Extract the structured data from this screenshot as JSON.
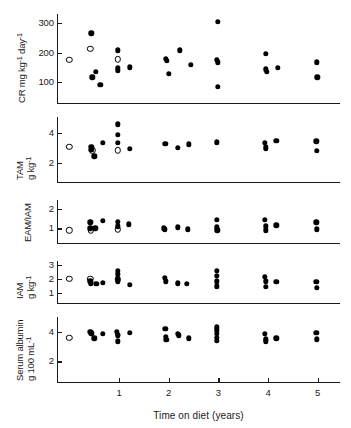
{
  "figure": {
    "xlabel": "Time on diet (years)",
    "x_ticks": [
      "1",
      "2",
      "3",
      "4",
      "5"
    ],
    "x_tick_values": [
      1,
      2,
      3,
      4,
      5
    ],
    "x_range": [
      -0.25,
      5.45
    ]
  },
  "panels": [
    {
      "id": "cr",
      "ylabel_line1": "CR  mg  kg",
      "ylabel_sup1": "-1",
      "ylabel_mid": " day",
      "ylabel_sup2": "-1",
      "ylabel_plain": "CR mg kg-1 day-1",
      "y_ticks": [
        "300",
        "200",
        "100"
      ],
      "y_tick_values": [
        300,
        200,
        100
      ],
      "y_range": [
        30,
        330
      ]
    },
    {
      "id": "tam",
      "ylabel_line1": "TAM",
      "ylabel_line2": "g kg",
      "ylabel_sup1": "-1",
      "ylabel_plain": "TAM g kg-1",
      "y_ticks": [
        "4",
        "2"
      ],
      "y_tick_values": [
        4,
        2
      ],
      "y_range": [
        0.7,
        5.1
      ]
    },
    {
      "id": "eam_iam",
      "ylabel_line1": "EAM/IAM",
      "ylabel_plain": "EAM/IAM",
      "y_ticks": [
        "2",
        "1"
      ],
      "y_tick_values": [
        2,
        1
      ],
      "y_range": [
        0.25,
        2.45
      ]
    },
    {
      "id": "iam",
      "ylabel_line1": "IAM",
      "ylabel_line2": "g kg",
      "ylabel_sup1": "-1",
      "ylabel_plain": "IAM g kg-1",
      "y_ticks": [
        "3",
        "2",
        "1"
      ],
      "y_tick_values": [
        3,
        2,
        1
      ],
      "y_range": [
        0.3,
        3.3
      ]
    },
    {
      "id": "albumin",
      "ylabel_line1": "Serum albumin",
      "ylabel_line2": "g 100 mL",
      "ylabel_sup1": "-1",
      "ylabel_plain": "Serum albumin g 100 mL-1",
      "y_ticks": [
        "4",
        "2"
      ],
      "y_tick_values": [
        4,
        2
      ],
      "y_range": [
        0.6,
        5.0
      ]
    }
  ],
  "chart_data": {
    "type": "scatter",
    "title": "",
    "xlabel": "Time on diet (years)",
    "legend": [],
    "grid": false,
    "xlim": [
      -0.25,
      5.45
    ],
    "x_ticks": [
      1,
      2,
      3,
      4,
      5
    ],
    "marker_types": {
      "filled": "on-diet measurement",
      "open": "baseline / pre-diet measurement"
    },
    "subplots": [
      {
        "id": "cr",
        "ylabel": "CR mg kg-1 day-1",
        "ylim": [
          30,
          330
        ],
        "y_ticks": [
          300,
          200,
          100
        ],
        "points_filled": [
          [
            0.44,
            265
          ],
          [
            0.46,
            117
          ],
          [
            0.53,
            135
          ],
          [
            0.62,
            92
          ],
          [
            0.97,
            207
          ],
          [
            0.97,
            148
          ],
          [
            0.97,
            140
          ],
          [
            1.22,
            150
          ],
          [
            1.94,
            180
          ],
          [
            1.96,
            173
          ],
          [
            2.0,
            128
          ],
          [
            2.22,
            208
          ],
          [
            2.44,
            158
          ],
          [
            2.99,
            303
          ],
          [
            2.97,
            175
          ],
          [
            2.99,
            167
          ],
          [
            2.99,
            85
          ],
          [
            3.95,
            196
          ],
          [
            3.96,
            143
          ],
          [
            3.97,
            136
          ],
          [
            4.2,
            148
          ],
          [
            4.98,
            167
          ],
          [
            4.99,
            117
          ]
        ],
        "points_open": [
          [
            0.0,
            175
          ],
          [
            0.42,
            212
          ],
          [
            0.97,
            177
          ]
        ]
      },
      {
        "id": "tam",
        "ylabel": "TAM g kg-1",
        "ylim": [
          0.7,
          5.1
        ],
        "y_ticks": [
          4,
          2
        ],
        "points_filled": [
          [
            0.44,
            3.1
          ],
          [
            0.44,
            2.9
          ],
          [
            0.5,
            2.45
          ],
          [
            0.67,
            3.35
          ],
          [
            0.97,
            4.6
          ],
          [
            0.97,
            3.9
          ],
          [
            0.97,
            3.35
          ],
          [
            1.22,
            2.95
          ],
          [
            1.93,
            3.3
          ],
          [
            2.18,
            3.0
          ],
          [
            2.4,
            3.25
          ],
          [
            2.97,
            3.4
          ],
          [
            3.94,
            3.35
          ],
          [
            3.95,
            3.1
          ],
          [
            3.95,
            2.95
          ],
          [
            4.17,
            3.5
          ],
          [
            4.97,
            3.45
          ],
          [
            4.98,
            2.8
          ]
        ],
        "points_open": [
          [
            0.0,
            3.1
          ],
          [
            0.46,
            2.85
          ],
          [
            0.97,
            2.85
          ]
        ]
      },
      {
        "id": "eam_iam",
        "ylabel": "EAM/IAM",
        "ylim": [
          0.25,
          2.45
        ],
        "y_ticks": [
          2,
          1
        ],
        "points_filled": [
          [
            0.42,
            1.3
          ],
          [
            0.42,
            1.0
          ],
          [
            0.52,
            1.0
          ],
          [
            0.67,
            1.4
          ],
          [
            0.97,
            1.35
          ],
          [
            0.97,
            1.1
          ],
          [
            1.2,
            1.2
          ],
          [
            1.9,
            1.0
          ],
          [
            1.92,
            0.95
          ],
          [
            2.18,
            1.05
          ],
          [
            2.38,
            0.95
          ],
          [
            2.97,
            1.45
          ],
          [
            2.97,
            1.05
          ],
          [
            2.98,
            0.9
          ],
          [
            3.94,
            1.45
          ],
          [
            3.95,
            1.1
          ],
          [
            3.96,
            0.9
          ],
          [
            4.17,
            1.15
          ],
          [
            4.97,
            1.3
          ],
          [
            4.98,
            0.95
          ]
        ],
        "points_open": [
          [
            0.0,
            0.9
          ],
          [
            0.43,
            0.9
          ],
          [
            0.97,
            0.95
          ]
        ]
      },
      {
        "id": "iam",
        "ylabel": "IAM g kg-1",
        "ylim": [
          0.3,
          3.3
        ],
        "y_ticks": [
          3,
          2,
          1
        ],
        "points_filled": [
          [
            0.42,
            1.85
          ],
          [
            0.43,
            1.7
          ],
          [
            0.54,
            1.65
          ],
          [
            0.67,
            1.75
          ],
          [
            0.97,
            2.6
          ],
          [
            0.97,
            2.35
          ],
          [
            0.97,
            2.05
          ],
          [
            0.97,
            1.85
          ],
          [
            1.22,
            1.6
          ],
          [
            1.92,
            2.1
          ],
          [
            1.94,
            1.85
          ],
          [
            2.18,
            1.7
          ],
          [
            2.36,
            1.65
          ],
          [
            2.97,
            2.6
          ],
          [
            2.97,
            2.25
          ],
          [
            2.97,
            1.85
          ],
          [
            2.97,
            1.5
          ],
          [
            3.94,
            2.15
          ],
          [
            3.95,
            1.85
          ],
          [
            3.95,
            1.45
          ],
          [
            4.17,
            1.8
          ],
          [
            4.97,
            1.8
          ],
          [
            4.98,
            1.4
          ]
        ],
        "points_open": [
          [
            0.0,
            2.05
          ],
          [
            0.42,
            2.05
          ],
          [
            0.97,
            2.0
          ]
        ]
      },
      {
        "id": "albumin",
        "ylabel": "Serum albumin g 100 mL-1",
        "ylim": [
          0.6,
          5.0
        ],
        "y_ticks": [
          4,
          2
        ],
        "points_filled": [
          [
            0.42,
            4.0
          ],
          [
            0.44,
            3.9
          ],
          [
            0.5,
            3.55
          ],
          [
            0.67,
            3.85
          ],
          [
            0.96,
            4.0
          ],
          [
            0.97,
            3.8
          ],
          [
            0.98,
            3.75
          ],
          [
            0.98,
            3.35
          ],
          [
            1.22,
            3.95
          ],
          [
            1.93,
            4.2
          ],
          [
            1.94,
            3.65
          ],
          [
            1.95,
            3.45
          ],
          [
            2.18,
            3.85
          ],
          [
            2.2,
            3.75
          ],
          [
            2.4,
            3.55
          ],
          [
            2.97,
            4.3
          ],
          [
            2.97,
            4.1
          ],
          [
            2.97,
            3.85
          ],
          [
            2.97,
            3.6
          ],
          [
            2.97,
            3.4
          ],
          [
            3.94,
            3.85
          ],
          [
            3.95,
            3.5
          ],
          [
            3.96,
            3.35
          ],
          [
            4.17,
            3.55
          ],
          [
            4.97,
            3.95
          ],
          [
            4.98,
            3.5
          ]
        ],
        "points_open": [
          [
            0.0,
            3.6
          ]
        ]
      }
    ]
  }
}
